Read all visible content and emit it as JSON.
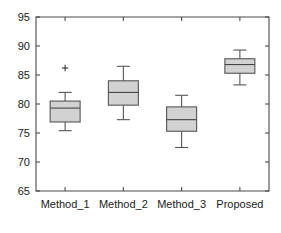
{
  "chart_data": {
    "type": "box",
    "title": "",
    "xlabel": "",
    "ylabel": "",
    "categories": [
      "Method_1",
      "Method_2",
      "Method_3",
      "Proposed"
    ],
    "ylim": [
      65,
      95
    ],
    "yticks": [
      65,
      70,
      75,
      80,
      85,
      90,
      95
    ],
    "ytick_labels": [
      "65",
      "70",
      "75",
      "80",
      "85",
      "90",
      "95"
    ],
    "grid": false,
    "legend": null,
    "box_fill_color": "#d2d2d2",
    "box_edge_color": "#555555",
    "axis_color": "#4a4a4a",
    "background_color": "#ffffff",
    "boxes": [
      {
        "label": "Method_1",
        "whisker_low": 75.4,
        "q1": 76.9,
        "median": 79.3,
        "q3": 80.5,
        "whisker_high": 82.0,
        "outliers": [
          86.2
        ]
      },
      {
        "label": "Method_2",
        "whisker_low": 77.3,
        "q1": 79.8,
        "median": 82.0,
        "q3": 84.0,
        "whisker_high": 86.5,
        "outliers": []
      },
      {
        "label": "Method_3",
        "whisker_low": 72.5,
        "q1": 75.3,
        "median": 77.3,
        "q3": 79.5,
        "whisker_high": 81.5,
        "outliers": []
      },
      {
        "label": "Proposed",
        "whisker_low": 83.3,
        "q1": 85.3,
        "median": 86.8,
        "q3": 87.8,
        "whisker_high": 89.3,
        "outliers": []
      }
    ]
  },
  "axis": {
    "y_labels": [
      "95",
      "90",
      "85",
      "80",
      "75",
      "70",
      "65"
    ],
    "x_labels": [
      "Method_1",
      "Method_2",
      "Method_3",
      "Proposed"
    ]
  }
}
